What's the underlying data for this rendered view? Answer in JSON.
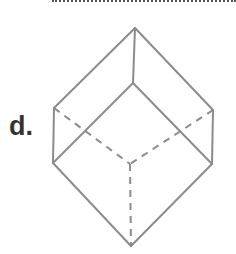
{
  "question": {
    "option_label": "d.",
    "figure": {
      "type": "wireframe-cube",
      "stroke_color": "#8c8c8c",
      "solid_edges": [
        [
          [
            135,
            28
          ],
          [
            54,
            108
          ]
        ],
        [
          [
            135,
            28
          ],
          [
            213,
            110
          ]
        ],
        [
          [
            135,
            28
          ],
          [
            133,
            83
          ]
        ],
        [
          [
            133,
            83
          ],
          [
            53,
            163
          ]
        ],
        [
          [
            133,
            83
          ],
          [
            212,
            164
          ]
        ],
        [
          [
            54,
            108
          ],
          [
            53,
            163
          ]
        ],
        [
          [
            213,
            110
          ],
          [
            212,
            164
          ]
        ],
        [
          [
            53,
            163
          ],
          [
            131,
            246
          ]
        ],
        [
          [
            212,
            164
          ],
          [
            131,
            246
          ]
        ]
      ],
      "hidden_edges": [
        [
          [
            54,
            108
          ],
          [
            130,
            164
          ]
        ],
        [
          [
            213,
            110
          ],
          [
            130,
            164
          ]
        ],
        [
          [
            130,
            164
          ],
          [
            131,
            246
          ]
        ]
      ]
    }
  }
}
